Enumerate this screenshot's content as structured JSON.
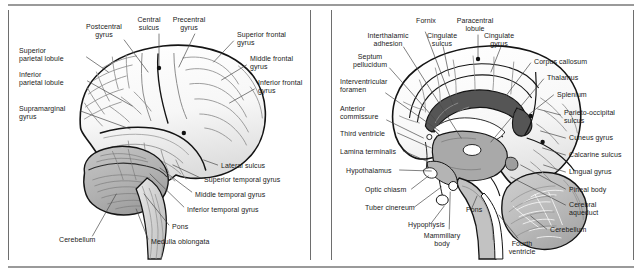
{
  "figure": {
    "panels": [
      {
        "id": "lateral-view",
        "name": "lateral-brain-view",
        "labels": [
          {
            "id": "postcentral-gyrus",
            "text": "Postcentral\ngyrus",
            "align": "c",
            "x": 95,
            "y": 13
          },
          {
            "id": "central-sulcus",
            "text": "Central\nsulcus",
            "align": "c",
            "x": 140,
            "y": 6
          },
          {
            "id": "precentral-gyrus",
            "text": "Precentral\ngyrus",
            "align": "c",
            "x": 180,
            "y": 6
          },
          {
            "id": "superior-frontal-gyrus",
            "text": "Superior frontal\ngyrus",
            "align": "l",
            "x": 228,
            "y": 21
          },
          {
            "id": "middle-frontal-gyrus",
            "text": "Middle frontal\ngyrus",
            "align": "l",
            "x": 241,
            "y": 45
          },
          {
            "id": "inferior-frontal-gyrus",
            "text": "Inferior frontal\ngyrus",
            "align": "l",
            "x": 249,
            "y": 69
          },
          {
            "id": "superior-parietal-lobule",
            "text": "Superior\nparietal lobule",
            "align": "l",
            "x": 10,
            "y": 37
          },
          {
            "id": "inferior-parietal-lobule",
            "text": "Inferior\nparietal lobule",
            "align": "l",
            "x": 10,
            "y": 61
          },
          {
            "id": "supramarginal-gyrus",
            "text": "Supramarginal\ngyrus",
            "align": "l",
            "x": 10,
            "y": 95
          },
          {
            "id": "lateral-sulcus",
            "text": "Lateral sulcus",
            "align": "l",
            "x": 212,
            "y": 152
          },
          {
            "id": "superior-temporal-gyrus",
            "text": "Superior temporal gyrus",
            "align": "l",
            "x": 195,
            "y": 166
          },
          {
            "id": "middle-temporal-gyrus",
            "text": "Middle temporal gyrus",
            "align": "l",
            "x": 186,
            "y": 181
          },
          {
            "id": "inferior-temporal-gyrus",
            "text": "Inferior temporal gyrus",
            "align": "l",
            "x": 178,
            "y": 196
          },
          {
            "id": "pons",
            "text": "Pons",
            "align": "l",
            "x": 163,
            "y": 213
          },
          {
            "id": "medulla-oblongata",
            "text": "Medulla oblongata",
            "align": "l",
            "x": 142,
            "y": 228
          },
          {
            "id": "cerebellum",
            "text": "Cerebellum",
            "align": "l",
            "x": 50,
            "y": 226
          }
        ]
      },
      {
        "id": "midsagittal-view",
        "name": "midsagittal-brain-view",
        "labels": [
          {
            "id": "fornix",
            "text": "Fornix",
            "align": "c",
            "x": 94,
            "y": 7
          },
          {
            "id": "paracentral-lobule",
            "text": "Paracentral\nlobule",
            "align": "c",
            "x": 143,
            "y": 7
          },
          {
            "id": "interthalamic-adhesion",
            "text": "Interthalamic\nadhesion",
            "align": "c",
            "x": 56,
            "y": 22
          },
          {
            "id": "cingulate-sulcus",
            "text": "Cingulate\nsulcus",
            "align": "c",
            "x": 110,
            "y": 22
          },
          {
            "id": "cingulate-gyrus",
            "text": "Cingulate\ngyrus",
            "align": "c",
            "x": 167,
            "y": 22
          },
          {
            "id": "septum-pellucidum",
            "text": "Septum\npellucidum",
            "align": "c",
            "x": 38,
            "y": 43
          },
          {
            "id": "corpus-callosum",
            "text": "Corpus callosum",
            "align": "l",
            "x": 202,
            "y": 48
          },
          {
            "id": "interventricular-foramen",
            "text": "Interventricular\nforamen",
            "align": "l",
            "x": 8,
            "y": 68
          },
          {
            "id": "thalamus",
            "text": "Thalamus",
            "align": "l",
            "x": 215,
            "y": 64
          },
          {
            "id": "splenium",
            "text": "Splenium",
            "align": "l",
            "x": 225,
            "y": 81
          },
          {
            "id": "anterior-commissure",
            "text": "Anterior\ncommissure",
            "align": "l",
            "x": 8,
            "y": 95
          },
          {
            "id": "parieto-occipital-sulcus",
            "text": "Parieto-occipital\nsulcus",
            "align": "l",
            "x": 232,
            "y": 99
          },
          {
            "id": "third-ventricle",
            "text": "Third ventricle",
            "align": "l",
            "x": 8,
            "y": 120
          },
          {
            "id": "cuneus-gyrus",
            "text": "Cuneus gyrus",
            "align": "l",
            "x": 237,
            "y": 124
          },
          {
            "id": "lamina-terminalis",
            "text": "Lamina terminalis",
            "align": "l",
            "x": 8,
            "y": 138
          },
          {
            "id": "calcarine-sulcus",
            "text": "Calcarine sulcus",
            "align": "l",
            "x": 237,
            "y": 141
          },
          {
            "id": "hypothalamus",
            "text": "Hypothalamus",
            "align": "l",
            "x": 14,
            "y": 157
          },
          {
            "id": "lingual-gyrus",
            "text": "Lingual gyrus",
            "align": "l",
            "x": 237,
            "y": 158
          },
          {
            "id": "optic-chiasm",
            "text": "Optic chiasm",
            "align": "l",
            "x": 33,
            "y": 176
          },
          {
            "id": "pineal-body",
            "text": "Pineal body",
            "align": "l",
            "x": 237,
            "y": 176
          },
          {
            "id": "tuber-cinereum",
            "text": "Tuber cinereum",
            "align": "l",
            "x": 33,
            "y": 194
          },
          {
            "id": "cerebral-aqueduct",
            "text": "Cerebral\naqueduct",
            "align": "l",
            "x": 237,
            "y": 191
          },
          {
            "id": "pons",
            "text": "Pons",
            "align": "l",
            "x": 134,
            "y": 196
          },
          {
            "id": "hypophysis",
            "text": "Hypophysis",
            "align": "l",
            "x": 76,
            "y": 211
          },
          {
            "id": "cerebellum",
            "text": "Cerebellum",
            "align": "l",
            "x": 218,
            "y": 216
          },
          {
            "id": "mammillary-body",
            "text": "Mammillary\nbody",
            "align": "c",
            "x": 110,
            "y": 222
          },
          {
            "id": "fourth-ventricle",
            "text": "Fourth\nventricle",
            "align": "c",
            "x": 190,
            "y": 230
          }
        ]
      }
    ]
  },
  "colors": {
    "rule": "#9a9a9a",
    "panel_border": "#6e6e6e",
    "outline": "#141414",
    "cortex_fill": "#fbfbfb",
    "cortex_shade": "#e3e3e3",
    "sulci_line": "#8d8d8d",
    "cerebellum_fill": "#b5b5b5",
    "cerebellum_line": "#6d6d6d",
    "brainstem_fill": "#c2c2c2",
    "thalamus_fill": "#a9a9a9",
    "corpus_callosum_fill": "#555555",
    "ventricle_fill": "#ffffff",
    "leader_line": "#4a4a4a",
    "marker_dot": "#111111",
    "text": "#1a1a1a"
  }
}
